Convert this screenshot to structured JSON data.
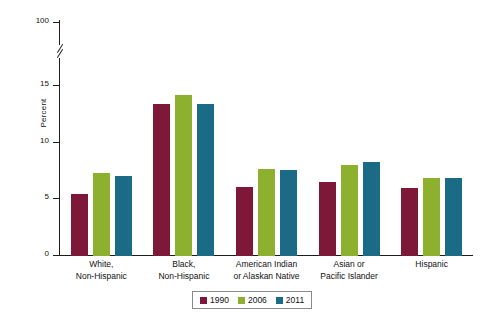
{
  "chart_data": {
    "type": "bar",
    "title": "",
    "xlabel": "",
    "ylabel": "Percent",
    "ylim": [
      0,
      100
    ],
    "ytick_labels": [
      "0",
      "5",
      "10",
      "15",
      "100"
    ],
    "yticks": [
      0,
      5,
      10,
      15,
      100
    ],
    "axis_break": true,
    "axis_break_between": [
      15,
      100
    ],
    "grid": false,
    "legend_position": "bottom",
    "categories": [
      "White,\nNon-Hispanic",
      "Black,\nNon-Hispanic",
      "American Indian\nor Alaskan Native",
      "Asian or\nPacific Islander",
      "Hispanic"
    ],
    "category_lines": [
      [
        "White,",
        "Non-Hispanic"
      ],
      [
        "Black,",
        "Non-Hispanic"
      ],
      [
        "American Indian",
        "or Alaskan Native"
      ],
      [
        "Asian or",
        "Pacific Islander"
      ],
      [
        "Hispanic",
        ""
      ]
    ],
    "series": [
      {
        "name": "1990",
        "color": "#7d1838",
        "values": [
          5.5,
          13.4,
          6.1,
          6.5,
          6.0
        ]
      },
      {
        "name": "2006",
        "color": "#8db12e",
        "values": [
          7.3,
          14.2,
          7.7,
          8.0,
          6.9
        ]
      },
      {
        "name": "2011",
        "color": "#1b6b87",
        "values": [
          7.1,
          13.4,
          7.6,
          8.3,
          6.9
        ]
      }
    ]
  },
  "legend": {
    "items": [
      {
        "label": "1990",
        "color": "#7d1838"
      },
      {
        "label": "2006",
        "color": "#8db12e"
      },
      {
        "label": "2011",
        "color": "#1b6b87"
      }
    ]
  }
}
